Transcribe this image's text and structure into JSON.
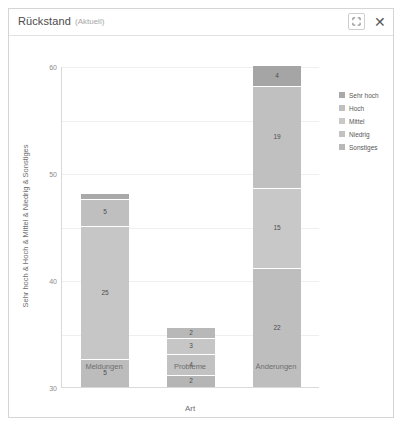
{
  "window": {
    "title": "Rückstand",
    "subtitle": "(Aktuell)",
    "expand_icon": "expand-icon",
    "close_icon": "close-icon",
    "close_glyph": "✕"
  },
  "chart_data": {
    "type": "bar",
    "stacked": true,
    "title": "",
    "xlabel": "Art",
    "ylabel": "Sehr hoch & Hoch & Mittel & Niedrig & Sonstiges",
    "categories": [
      "Meldungen",
      "Probleme",
      "Änderungen"
    ],
    "ylim": [
      0,
      60
    ],
    "yticks": [
      0,
      10,
      20,
      30,
      40,
      50,
      60
    ],
    "ytick_labels": [
      "0",
      "10",
      "20",
      "30",
      "40",
      "50",
      "60"
    ],
    "grid": true,
    "legend_position": "right",
    "series": [
      {
        "name": "Sehr hoch",
        "color": "#a8a8a8",
        "values": [
          1,
          0,
          4
        ]
      },
      {
        "name": "Hoch",
        "color": "#bdbdbd",
        "values": [
          5,
          2,
          19
        ]
      },
      {
        "name": "Mittel",
        "color": "#c9c9c9",
        "values": [
          25,
          3,
          15
        ]
      },
      {
        "name": "Niedrig",
        "color": "#bdbdbd",
        "values": [
          0,
          4,
          22
        ]
      },
      {
        "name": "Sonstiges",
        "color": "#b5b5b5",
        "values": [
          5,
          2,
          0
        ]
      }
    ],
    "bars": [
      {
        "category": "Meldungen",
        "total": 36,
        "segments": [
          {
            "series": "Sehr hoch",
            "value": 1,
            "label": "",
            "color": "#a9a9a9"
          },
          {
            "series": "Hoch",
            "value": 5,
            "label": "5",
            "color": "#bfbfbf"
          },
          {
            "series": "Mittel",
            "value": 25,
            "label": "25",
            "color": "#c6c6c6"
          },
          {
            "series": "Sonstiges",
            "value": 5,
            "label": "5",
            "color": "#bcbcbc"
          }
        ]
      },
      {
        "category": "Probleme",
        "total": 11,
        "segments": [
          {
            "series": "Hoch",
            "value": 2,
            "label": "2",
            "color": "#b8b8b8"
          },
          {
            "series": "Mittel",
            "value": 3,
            "label": "3",
            "color": "#c6c6c6"
          },
          {
            "series": "Niedrig",
            "value": 4,
            "label": "4",
            "color": "#c2c2c2"
          },
          {
            "series": "Sonstiges",
            "value": 2,
            "label": "2",
            "color": "#b5b5b5"
          }
        ]
      },
      {
        "category": "Änderungen",
        "total": 60,
        "segments": [
          {
            "series": "Sehr hoch",
            "value": 4,
            "label": "4",
            "color": "#a5a5a5"
          },
          {
            "series": "Hoch",
            "value": 19,
            "label": "19",
            "color": "#c0c0c0"
          },
          {
            "series": "Mittel",
            "value": 15,
            "label": "15",
            "color": "#c8c8c8"
          },
          {
            "series": "Niedrig",
            "value": 22,
            "label": "22",
            "color": "#bebebe"
          }
        ]
      }
    ],
    "legend": [
      {
        "label": "Sehr hoch",
        "color": "#a9a9a9"
      },
      {
        "label": "Hoch",
        "color": "#c0c0c0"
      },
      {
        "label": "Mittel",
        "color": "#c9c9c9"
      },
      {
        "label": "Niedrig",
        "color": "#c2c2c2"
      },
      {
        "label": "Sonstiges",
        "color": "#b8b8b8"
      }
    ]
  }
}
